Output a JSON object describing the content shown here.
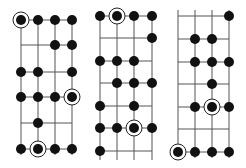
{
  "style": {
    "background": "#ffffff",
    "line_color": "#555555",
    "dot_color": "#111111",
    "root_ring_color": "#222222",
    "dot_radius": 5,
    "ring_radius": 8
  },
  "diagrams": [
    {
      "name": "scale-pattern-1",
      "columns_x": [
        21,
        38,
        55,
        72
      ],
      "rows_y": [
        20,
        45,
        72,
        97,
        123,
        149
      ],
      "string_top": 20,
      "string_bottom": 155,
      "dots": [
        {
          "row": 0,
          "col": 0,
          "root": true
        },
        {
          "row": 0,
          "col": 1
        },
        {
          "row": 0,
          "col": 2
        },
        {
          "row": 0,
          "col": 3
        },
        {
          "row": 1,
          "col": 2
        },
        {
          "row": 1,
          "col": 3
        },
        {
          "row": 2,
          "col": 0
        },
        {
          "row": 2,
          "col": 1
        },
        {
          "row": 2,
          "col": 3
        },
        {
          "row": 3,
          "col": 0
        },
        {
          "row": 3,
          "col": 1
        },
        {
          "row": 3,
          "col": 2
        },
        {
          "row": 3,
          "col": 3,
          "root": true
        },
        {
          "row": 4,
          "col": 1
        },
        {
          "row": 5,
          "col": 0
        },
        {
          "row": 5,
          "col": 1,
          "root": true
        },
        {
          "row": 5,
          "col": 2
        },
        {
          "row": 5,
          "col": 3
        }
      ]
    },
    {
      "name": "scale-pattern-2",
      "columns_x": [
        100,
        117,
        134,
        152
      ],
      "rows_y": [
        16,
        38,
        61,
        83,
        106,
        128,
        151
      ],
      "string_top": 16,
      "string_bottom": 160,
      "dots": [
        {
          "row": 0,
          "col": 0
        },
        {
          "row": 0,
          "col": 1,
          "root": true
        },
        {
          "row": 0,
          "col": 2
        },
        {
          "row": 0,
          "col": 3
        },
        {
          "row": 1,
          "col": 3
        },
        {
          "row": 2,
          "col": 0
        },
        {
          "row": 2,
          "col": 1
        },
        {
          "row": 2,
          "col": 2
        },
        {
          "row": 3,
          "col": 1
        },
        {
          "row": 3,
          "col": 2
        },
        {
          "row": 3,
          "col": 3
        },
        {
          "row": 4,
          "col": 0
        },
        {
          "row": 4,
          "col": 2
        },
        {
          "row": 5,
          "col": 0
        },
        {
          "row": 5,
          "col": 1
        },
        {
          "row": 5,
          "col": 2,
          "root": true
        },
        {
          "row": 5,
          "col": 3
        },
        {
          "row": 6,
          "col": 0
        }
      ]
    },
    {
      "name": "scale-pattern-3",
      "columns_x": [
        178,
        195,
        212,
        229
      ],
      "rows_y": [
        16,
        39,
        62,
        84,
        107,
        129,
        152
      ],
      "string_top": 10,
      "string_bottom": 158,
      "dots": [
        {
          "row": 0,
          "col": 3
        },
        {
          "row": 1,
          "col": 1
        },
        {
          "row": 1,
          "col": 2
        },
        {
          "row": 2,
          "col": 1
        },
        {
          "row": 2,
          "col": 2
        },
        {
          "row": 2,
          "col": 3
        },
        {
          "row": 3,
          "col": 2
        },
        {
          "row": 4,
          "col": 1
        },
        {
          "row": 4,
          "col": 2,
          "root": true
        },
        {
          "row": 4,
          "col": 3
        },
        {
          "row": 6,
          "col": 0,
          "root": true
        },
        {
          "row": 6,
          "col": 1
        },
        {
          "row": 6,
          "col": 2
        },
        {
          "row": 6,
          "col": 3
        }
      ]
    }
  ]
}
